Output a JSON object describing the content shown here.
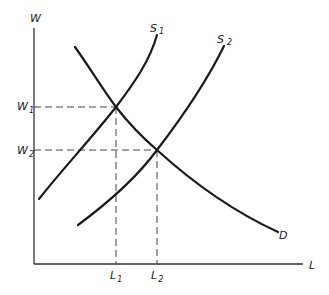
{
  "diagram": {
    "type": "supply-demand labor market",
    "axes": {
      "y_label": "W",
      "x_label": "L"
    },
    "curves": [
      {
        "id": "S1",
        "label": "S",
        "subscript": "1",
        "kind": "supply"
      },
      {
        "id": "S2",
        "label": "S",
        "subscript": "2",
        "kind": "supply"
      },
      {
        "id": "D",
        "label": "D",
        "kind": "demand"
      }
    ],
    "y_ticks": [
      {
        "label": "W",
        "subscript": "1"
      },
      {
        "label": "W",
        "subscript": "2"
      }
    ],
    "x_ticks": [
      {
        "label": "L",
        "subscript": "1"
      },
      {
        "label": "L",
        "subscript": "2"
      }
    ],
    "equilibria": [
      {
        "name": "E1",
        "curves": [
          "S1",
          "D"
        ],
        "wage": "W1",
        "labor": "L1"
      },
      {
        "name": "E2",
        "curves": [
          "S2",
          "D"
        ],
        "wage": "W2",
        "labor": "L2"
      }
    ],
    "colors": {
      "line": "#1a1a1a",
      "axis": "#333333",
      "background": "#ffffff"
    }
  }
}
